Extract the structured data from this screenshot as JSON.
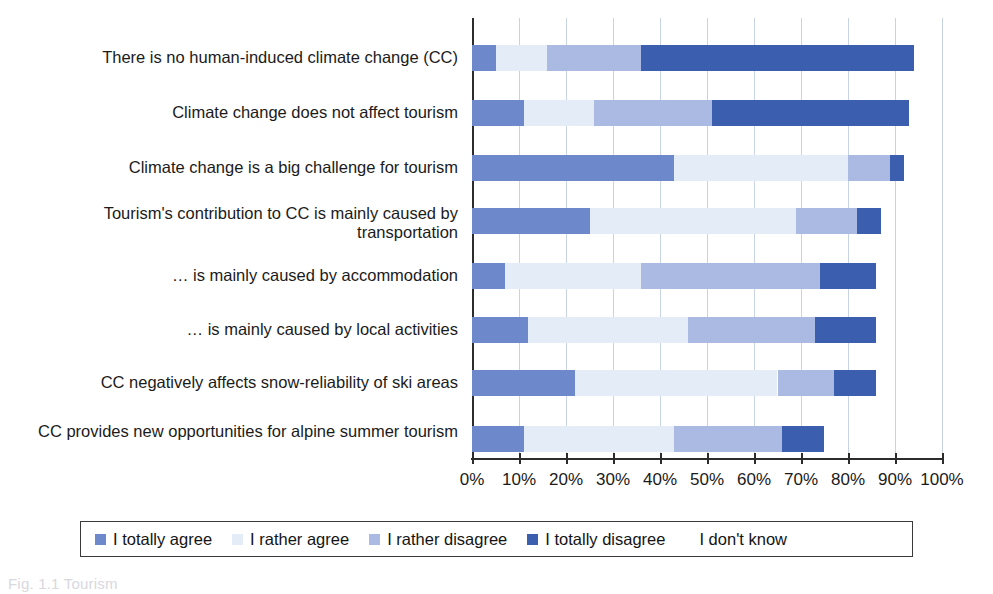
{
  "chart_data": {
    "type": "bar",
    "orientation": "horizontal",
    "stacked": true,
    "title": "",
    "xlabel": "",
    "ylabel": "",
    "xlim": [
      0,
      100
    ],
    "xtick_labels": [
      "0%",
      "10%",
      "20%",
      "30%",
      "40%",
      "50%",
      "60%",
      "70%",
      "80%",
      "90%",
      "100%"
    ],
    "xtick_values": [
      0,
      10,
      20,
      30,
      40,
      50,
      60,
      70,
      80,
      90,
      100
    ],
    "grid": "vertical",
    "legend_position": "bottom",
    "categories": [
      "There is no human-induced climate change (CC)",
      "Climate change does not affect tourism",
      "Climate change is a big challenge for tourism",
      "Tourism's contribution to CC is mainly caused by transportation",
      "… is mainly caused by accommodation",
      "… is mainly caused by local activities",
      "CC negatively affects snow-reliability of ski areas",
      "CC provides new opportunities for alpine summer tourism"
    ],
    "series": [
      {
        "name": "I totally agree",
        "color": "#6d88cb",
        "values": [
          5,
          11,
          43,
          25,
          7,
          12,
          22,
          11
        ]
      },
      {
        "name": "I rather agree",
        "color": "#e4ecf8",
        "values": [
          11,
          15,
          37,
          44,
          29,
          34,
          43,
          32
        ]
      },
      {
        "name": "I rather disagree",
        "color": "#aabae2",
        "values": [
          20,
          25,
          9,
          13,
          38,
          27,
          12,
          23
        ]
      },
      {
        "name": "I totally disagree",
        "color": "#3b5fae",
        "values": [
          58,
          42,
          3,
          5,
          12,
          13,
          9,
          9
        ]
      },
      {
        "name": "I don't know",
        "color": "#ffffff",
        "values": [
          6,
          7,
          8,
          13,
          14,
          14,
          14,
          25
        ]
      }
    ],
    "cumulative_ends_percent": [
      [
        5,
        16,
        36,
        94
      ],
      [
        11,
        26,
        51,
        93
      ],
      [
        43,
        80,
        89,
        92
      ],
      [
        25,
        69,
        82,
        87
      ],
      [
        7,
        36,
        74,
        86
      ],
      [
        12,
        46,
        73,
        87
      ],
      [
        22,
        65,
        77,
        86
      ],
      [
        11,
        43,
        66,
        75
      ]
    ]
  },
  "legend": {
    "items": [
      {
        "label": "I totally agree",
        "color": "#6d88cb",
        "has_swatch": true
      },
      {
        "label": "I rather agree",
        "color": "#e4ecf8",
        "has_swatch": true
      },
      {
        "label": "I rather disagree",
        "color": "#aabae2",
        "has_swatch": true
      },
      {
        "label": "I totally disagree",
        "color": "#3b5fae",
        "has_swatch": true
      },
      {
        "label": "I don't know",
        "color": "#ffffff",
        "has_swatch": false
      }
    ]
  },
  "caption": {
    "text": "Fig. 1.1  Tourism"
  }
}
